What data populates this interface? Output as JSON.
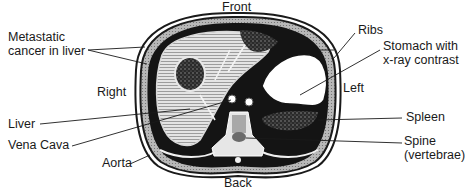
{
  "diagram": {
    "orientation": {
      "front": "Front",
      "back": "Back",
      "right": "Right",
      "left": "Left"
    },
    "labels": {
      "metastatic_line1": "Metastatic",
      "metastatic_line2": "cancer in liver",
      "liver": "Liver",
      "vena_cava": "Vena Cava",
      "aorta": "Aorta",
      "ribs": "Ribs",
      "stomach_line1": "Stomach with",
      "stomach_line2": "x-ray contrast",
      "spleen": "Spleen",
      "spine_line1": "Spine",
      "spine_line2": "(vertebrae)"
    },
    "colors": {
      "ink": "#1a1a1a",
      "tissue": "#bdbdbd",
      "liver": "#cfcfcf",
      "dark": "#141414",
      "paper": "#ffffff"
    }
  }
}
